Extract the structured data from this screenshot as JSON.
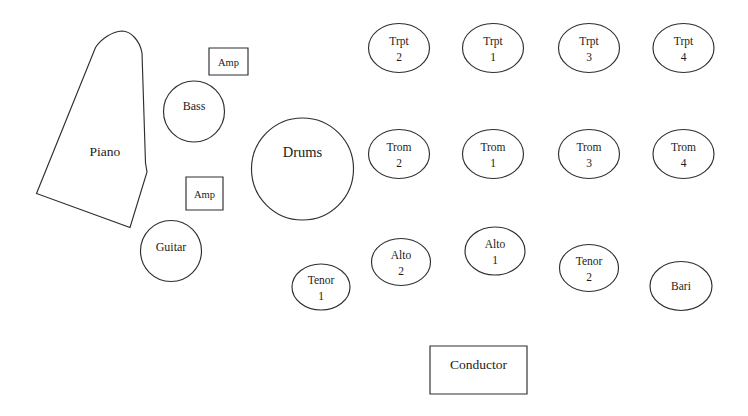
{
  "diagram": {
    "background_color": "#ffffff",
    "stroke_color": "#2e2e33",
    "text_color": "#1c1c20",
    "width": 748,
    "height": 416
  },
  "rhythm_section": {
    "piano": {
      "label": "Piano",
      "label_x": 105,
      "label_y": 156,
      "size": "lg"
    },
    "bass": {
      "label": "Bass",
      "cx": 194,
      "cy": 111.5,
      "r": 30.5,
      "label_y": 110,
      "size": "md"
    },
    "guitar": {
      "label": "Guitar",
      "cx": 171,
      "cy": 251,
      "r": 30.5,
      "label_y": 251,
      "size": "md"
    },
    "drums": {
      "label": "Drums",
      "cx": 302.5,
      "cy": 169,
      "r": 51,
      "label_y": 157,
      "size": "xl"
    },
    "amp_top": {
      "label": "Amp",
      "x": 209,
      "y": 48,
      "w": 39,
      "h": 27,
      "label_y": 66,
      "size": "sm"
    },
    "amp_bottom": {
      "label": "Amp",
      "x": 186,
      "y": 177,
      "w": 37,
      "h": 33,
      "label_y": 198,
      "size": "sm"
    }
  },
  "trumpets": {
    "row_label": "Trumpets",
    "members": [
      {
        "part": "Trpt",
        "number": "2",
        "cx": 399,
        "cy": 48,
        "rx": 30.5,
        "ry": 24.5
      },
      {
        "part": "Trpt",
        "number": "1",
        "cx": 493,
        "cy": 48,
        "rx": 30.5,
        "ry": 24.5
      },
      {
        "part": "Trpt",
        "number": "3",
        "cx": 589,
        "cy": 48,
        "rx": 30.5,
        "ry": 24.5
      },
      {
        "part": "Trpt",
        "number": "4",
        "cx": 683.5,
        "cy": 48,
        "rx": 30.5,
        "ry": 24.5
      }
    ]
  },
  "trombones": {
    "row_label": "Trombones",
    "members": [
      {
        "part": "Trom",
        "number": "2",
        "cx": 399,
        "cy": 154,
        "rx": 30.5,
        "ry": 24.5
      },
      {
        "part": "Trom",
        "number": "1",
        "cx": 493,
        "cy": 154,
        "rx": 30.5,
        "ry": 24.5
      },
      {
        "part": "Trom",
        "number": "3",
        "cx": 589,
        "cy": 154,
        "rx": 30.5,
        "ry": 24.5
      },
      {
        "part": "Trom",
        "number": "4",
        "cx": 683.5,
        "cy": 154,
        "rx": 30.5,
        "ry": 24.5
      }
    ]
  },
  "saxophones": {
    "row_label": "Saxophones",
    "members": [
      {
        "part": "Tenor",
        "number": "1",
        "cx": 321,
        "cy": 287,
        "rx": 29,
        "ry": 23
      },
      {
        "part": "Alto",
        "number": "2",
        "cx": 401,
        "cy": 262,
        "rx": 29.5,
        "ry": 23.5
      },
      {
        "part": "Alto",
        "number": "1",
        "cx": 495,
        "cy": 251,
        "rx": 30,
        "ry": 24
      },
      {
        "part": "Tenor",
        "number": "2",
        "cx": 589,
        "cy": 268,
        "rx": 29.5,
        "ry": 23.5
      },
      {
        "part": "Bari",
        "number": "",
        "cx": 681,
        "cy": 286,
        "rx": 31,
        "ry": 24.5
      }
    ]
  },
  "conductor": {
    "label": "Conductor",
    "x": 430,
    "y": 346,
    "w": 97,
    "h": 48,
    "label_y": 369,
    "size": "lg"
  }
}
